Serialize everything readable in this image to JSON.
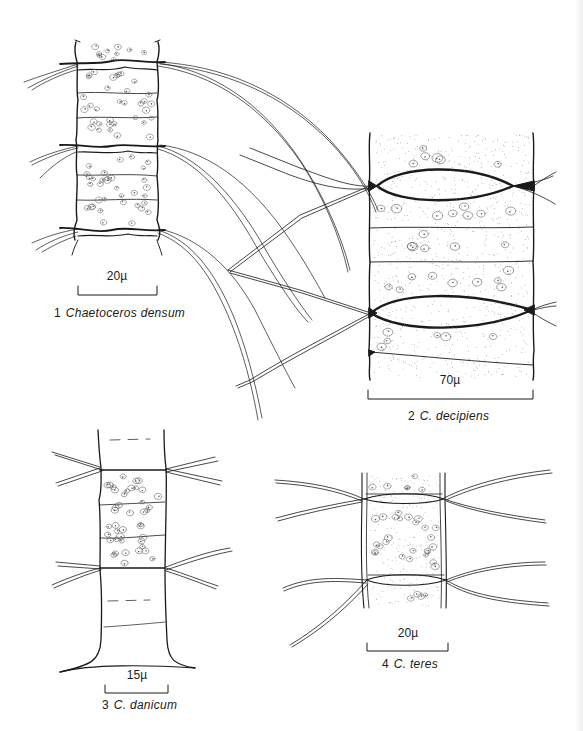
{
  "plate": {
    "figures": [
      {
        "number": "1",
        "species": "Chaetoceros densum",
        "scale_bar": "20µ"
      },
      {
        "number": "2",
        "species": "C. decipiens",
        "scale_bar": "70µ"
      },
      {
        "number": "3",
        "species": "C. danicum",
        "scale_bar": "15µ"
      },
      {
        "number": "4",
        "species": "C. teres",
        "scale_bar": "20µ"
      }
    ]
  },
  "colors": {
    "ink": "#1a1a1a",
    "stipple": "#6a6a6a",
    "paper": "#ffffff"
  }
}
